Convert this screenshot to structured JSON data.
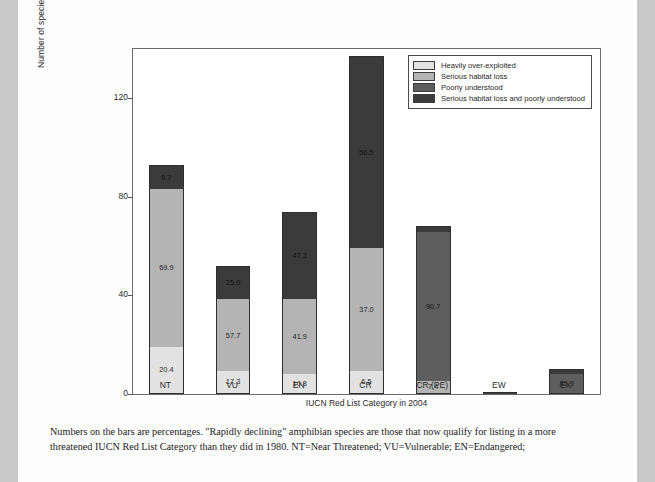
{
  "figure": {
    "y_axis_title": "Number of species that have changed category from 1980 to 2004",
    "x_axis_title": "IUCN Red List Category in 2004"
  },
  "caption": {
    "line1": "Numbers on the bars are percentages. \"Rapidly declining\" amphibian species are those that now qualify for listing in a more",
    "line2": "threatened IUCN Red List Category than they did in 1980. NT=Near Threatened; VU=Vulnerable; EN=Endangered;"
  },
  "chart_data": {
    "type": "bar",
    "stacked": true,
    "title": "",
    "xlabel": "IUCN Red List Category in 2004",
    "ylabel": "Number of species that have changed category from 1980 to 2004",
    "ylim": [
      0,
      140
    ],
    "yticks": [
      0,
      40,
      80,
      120
    ],
    "grid": false,
    "legend_position": "top-right",
    "categories": [
      "NT",
      "VU",
      "EN",
      "CR",
      "CR (PE)",
      "EW",
      "EX"
    ],
    "totals": [
      93,
      52,
      74,
      137,
      68,
      1,
      10
    ],
    "series": [
      {
        "name": "Heavily over-exploited",
        "color": "#e2e2e2",
        "values": [
          19.0,
          9.0,
          8.0,
          8.9,
          0,
          0,
          0
        ],
        "percent_labels": [
          "20.4",
          "17.3",
          "10.8",
          "6.5",
          "",
          "",
          ""
        ]
      },
      {
        "name": "Serious habitat loss",
        "color": "#b4b4b4",
        "values": [
          65.0,
          30.0,
          31.0,
          50.7,
          5.0,
          0,
          0
        ],
        "percent_labels": [
          "69.9",
          "57.7",
          "41.9",
          "37.0",
          "7.4",
          "",
          ""
        ]
      },
      {
        "name": "Poorly understood",
        "color": "#5e5e5e",
        "values": [
          0,
          0,
          0,
          0,
          61.7,
          0,
          8.6
        ],
        "percent_labels": [
          "",
          "",
          "",
          "",
          "90.7",
          "",
          "85.9"
        ]
      },
      {
        "name": "Serious habitat loss and poorly understood",
        "color": "#3b3b3b",
        "values": [
          9.0,
          13.0,
          35.0,
          77.4,
          1.3,
          1.0,
          1.4
        ],
        "percent_labels": [
          "9.7",
          "25.0",
          "47.3",
          "56.5",
          "",
          "",
          ""
        ]
      }
    ]
  }
}
